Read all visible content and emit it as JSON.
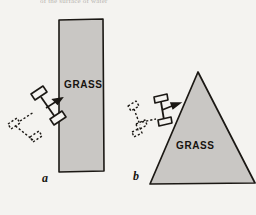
{
  "figure": {
    "caption_strip": "of the surface of water",
    "background_color": "#f4f3f0",
    "grass_fill_color": "#c9c7c4",
    "outline_color": "#1b1814",
    "panels": [
      {
        "id": "a",
        "label": "a",
        "region_shape": "rectangle",
        "region_label": "GRASS",
        "cart": {
          "state": "crossing-boundary",
          "phantom": "dashed",
          "arrow": "velocity-arrow"
        }
      },
      {
        "id": "b",
        "label": "b",
        "region_shape": "triangle",
        "region_label": "GRASS",
        "cart": {
          "state": "crossing-boundary",
          "phantom": "dashed",
          "arrow": "velocity-arrow"
        }
      }
    ]
  }
}
